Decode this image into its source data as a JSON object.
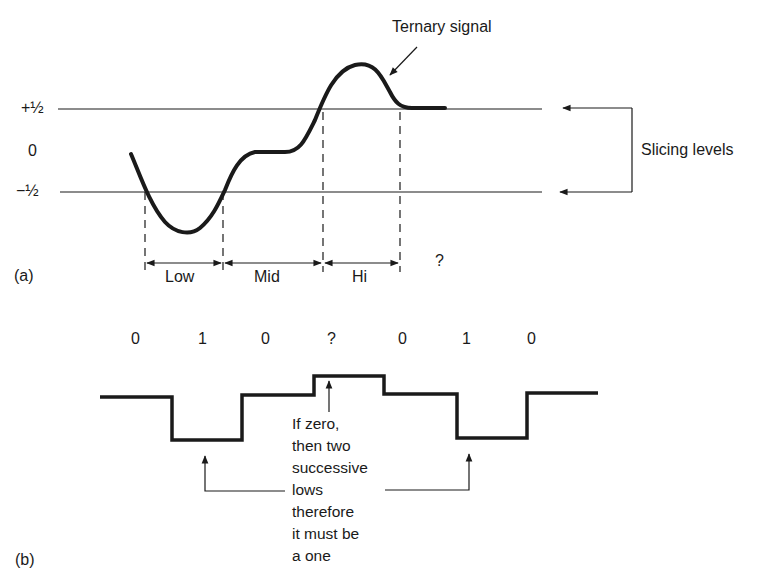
{
  "panel_a": {
    "label": "(a)",
    "title_annotation": "Ternary signal",
    "levels": {
      "plus_half": "+½",
      "zero": "0",
      "minus_half": "−½"
    },
    "slicing_label": "Slicing levels",
    "regions": [
      "Low",
      "Mid",
      "Hi"
    ],
    "unknown_region": "?"
  },
  "panel_b": {
    "label": "(b)",
    "bits": [
      "0",
      "1",
      "0",
      "?",
      "0",
      "1",
      "0"
    ],
    "annotation": "If zero,\nthen two\nsuccessive\nlows\ntherefore\nit must be\na one"
  },
  "colors": {
    "ink": "#1a1a1a",
    "background": "#ffffff"
  }
}
